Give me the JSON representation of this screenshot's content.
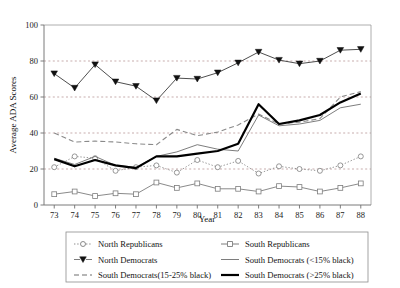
{
  "chart_data": {
    "type": "line",
    "title": "",
    "xlabel": "Year",
    "ylabel": "Average ADA Scores",
    "x": [
      73,
      74,
      75,
      76,
      77,
      78,
      79,
      80,
      81,
      82,
      83,
      84,
      85,
      86,
      87,
      88
    ],
    "xtick_labels": [
      "73",
      "74",
      "75",
      "76",
      "77",
      "78",
      "79",
      "80",
      "81",
      "82",
      "83",
      "84",
      "85",
      "86",
      "87",
      "88"
    ],
    "ytick_labels": [
      "0",
      "20",
      "40",
      "60",
      "80",
      "100"
    ],
    "yticks": [
      0,
      20,
      40,
      60,
      80,
      100
    ],
    "ylim": [
      0,
      100
    ],
    "xlim": [
      72.5,
      88.5
    ],
    "grid": "horizontal-dotted",
    "legend_position": "below-plot",
    "series": [
      {
        "name": "North Republicans",
        "marker": "open-circle",
        "line_style": "dotted",
        "color": "#7d7d7d",
        "values": [
          21,
          27,
          26,
          19,
          21,
          22,
          18,
          25,
          21,
          24.5,
          17.5,
          21.5,
          20,
          19,
          22,
          27
        ]
      },
      {
        "name": "North Democrats",
        "marker": "filled-down-triangle",
        "line_style": "solid",
        "color": "#3a3a3a",
        "values": [
          73,
          65,
          78,
          68.5,
          66,
          58,
          70.5,
          70,
          73.5,
          79,
          85,
          80.5,
          78.5,
          80,
          86,
          86.5
        ]
      },
      {
        "name": "South Democrats(15-25% black)",
        "marker": "none",
        "line_style": "dashed",
        "color": "#8a8a8a",
        "values": [
          40,
          35,
          35.5,
          35,
          34,
          33.5,
          42,
          38.5,
          40.5,
          44.5,
          50.5,
          45,
          46,
          48,
          60,
          63
        ]
      },
      {
        "name": "South Republicans",
        "marker": "open-square",
        "line_style": "solid",
        "color": "#7d7d7d",
        "values": [
          6,
          7.5,
          5,
          6.5,
          6,
          12.5,
          9.5,
          12,
          9,
          9,
          7.5,
          10.5,
          10,
          7.5,
          9.5,
          12
        ]
      },
      {
        "name": "South Democrats (<15% black)",
        "marker": "none",
        "line_style": "solid-thin",
        "color": "#6e6e6e",
        "values": [
          26,
          22.5,
          27,
          22,
          21,
          27,
          29.5,
          33.5,
          31,
          30,
          50,
          44,
          45,
          47,
          54,
          56
        ]
      },
      {
        "name": "South Democrats (>25% black)",
        "marker": "none",
        "line_style": "solid-thick",
        "color": "#000000",
        "values": [
          25.5,
          21.5,
          25,
          22,
          20.5,
          27,
          27,
          28.5,
          30,
          34,
          56,
          45,
          47,
          50,
          57,
          62
        ]
      }
    ]
  },
  "axes": {
    "y_title": "Average ADA Scores",
    "x_title": "Year"
  },
  "legend": {
    "entries": [
      {
        "label": "North Republicans",
        "marker": "open-circle",
        "style": "dotted"
      },
      {
        "label": "South Republicans",
        "marker": "open-square",
        "style": "solid"
      },
      {
        "label": "North Democrats",
        "marker": "filled-down-triangle",
        "style": "solid"
      },
      {
        "label": "South Democrats (<15% black)",
        "marker": "none",
        "style": "solid-thin"
      },
      {
        "label": "South Democrats(15-25% black)",
        "marker": "none",
        "style": "dashed"
      },
      {
        "label": "South Democrats (>25% black)",
        "marker": "none",
        "style": "solid-thick"
      }
    ]
  },
  "colors": {
    "grid": "#b08a8a",
    "axis": "#7a7a7a",
    "north_democrats": "#3a3a3a",
    "south_democrats_high_black": "#000000",
    "background": "#ffffff"
  }
}
